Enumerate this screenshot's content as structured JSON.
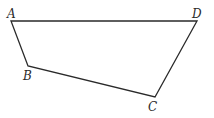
{
  "diagram": {
    "type": "quadrilateral",
    "stroke_color": "#2a2a2a",
    "background": "#ffffff",
    "vertices": [
      {
        "name": "A",
        "x": 11,
        "y": 21,
        "label_x": 7,
        "label_y": 18
      },
      {
        "name": "B",
        "x": 28,
        "y": 66,
        "label_x": 23,
        "label_y": 80
      },
      {
        "name": "C",
        "x": 155,
        "y": 97,
        "label_x": 148,
        "label_y": 111
      },
      {
        "name": "D",
        "x": 197,
        "y": 21,
        "label_x": 192,
        "label_y": 18
      }
    ],
    "edges": [
      [
        "A",
        "D"
      ],
      [
        "D",
        "C"
      ],
      [
        "C",
        "B"
      ],
      [
        "B",
        "A"
      ]
    ]
  }
}
